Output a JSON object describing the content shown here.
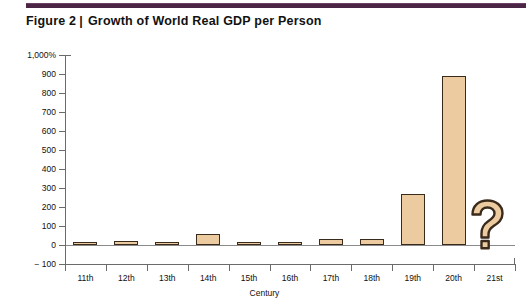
{
  "figure": {
    "label": "Figure 2",
    "divider": "|",
    "title": "Growth of World Real GDP per Person",
    "rule_color": "#4a2545"
  },
  "chart_data": {
    "type": "bar",
    "title": "Growth of World Real GDP per Person",
    "xlabel": "Century",
    "ylabel": "",
    "categories": [
      "11th",
      "12th",
      "13th",
      "14th",
      "15th",
      "16th",
      "17th",
      "18th",
      "19th",
      "20th",
      "21st"
    ],
    "values": [
      10,
      20,
      18,
      60,
      15,
      5,
      30,
      30,
      270,
      890,
      null
    ],
    "value_notes": {
      "21st": "?"
    },
    "ylim": [
      -100,
      1000
    ],
    "ytick_labels": [
      "1,000%",
      "900",
      "800",
      "700",
      "600",
      "500",
      "400",
      "300",
      "200",
      "100",
      "0",
      "-100"
    ],
    "ytick_values": [
      1000,
      900,
      800,
      700,
      600,
      500,
      400,
      300,
      200,
      100,
      0,
      -100
    ],
    "grid": false,
    "legend": false,
    "bar_fill": "#eccba0",
    "bar_edge": "#3a2a1c",
    "unknown_marker": "?"
  }
}
